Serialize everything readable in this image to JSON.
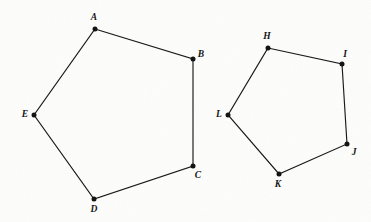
{
  "figure": {
    "background_color": "#fdfdfc",
    "stroke_color": "#1a1a1a",
    "vertex_color": "#141414",
    "canvas": {
      "width": 371,
      "height": 222
    }
  },
  "shapes": [
    {
      "id": "pentagon-abcde",
      "name": "Pentagon ABCDE",
      "closed": true,
      "vertices": [
        {
          "label": "A",
          "x": 95,
          "y": 29,
          "label_x": 94,
          "label_y": 20
        },
        {
          "label": "B",
          "x": 193,
          "y": 59,
          "label_x": 201,
          "label_y": 57
        },
        {
          "label": "C",
          "x": 193,
          "y": 166,
          "label_x": 198,
          "label_y": 178
        },
        {
          "label": "D",
          "x": 94,
          "y": 199,
          "label_x": 94,
          "label_y": 212
        },
        {
          "label": "E",
          "x": 34,
          "y": 115,
          "label_x": 25,
          "label_y": 117
        }
      ]
    },
    {
      "id": "pentagon-hijkl",
      "name": "Pentagon HIJKL",
      "closed": true,
      "vertices": [
        {
          "label": "H",
          "x": 268,
          "y": 48,
          "label_x": 267,
          "label_y": 39
        },
        {
          "label": "I",
          "x": 342,
          "y": 64,
          "label_x": 345,
          "label_y": 57
        },
        {
          "label": "J",
          "x": 347,
          "y": 144,
          "label_x": 354,
          "label_y": 155
        },
        {
          "label": "K",
          "x": 279,
          "y": 174,
          "label_x": 278,
          "label_y": 187
        },
        {
          "label": "L",
          "x": 228,
          "y": 115,
          "label_x": 219,
          "label_y": 117
        }
      ]
    }
  ]
}
